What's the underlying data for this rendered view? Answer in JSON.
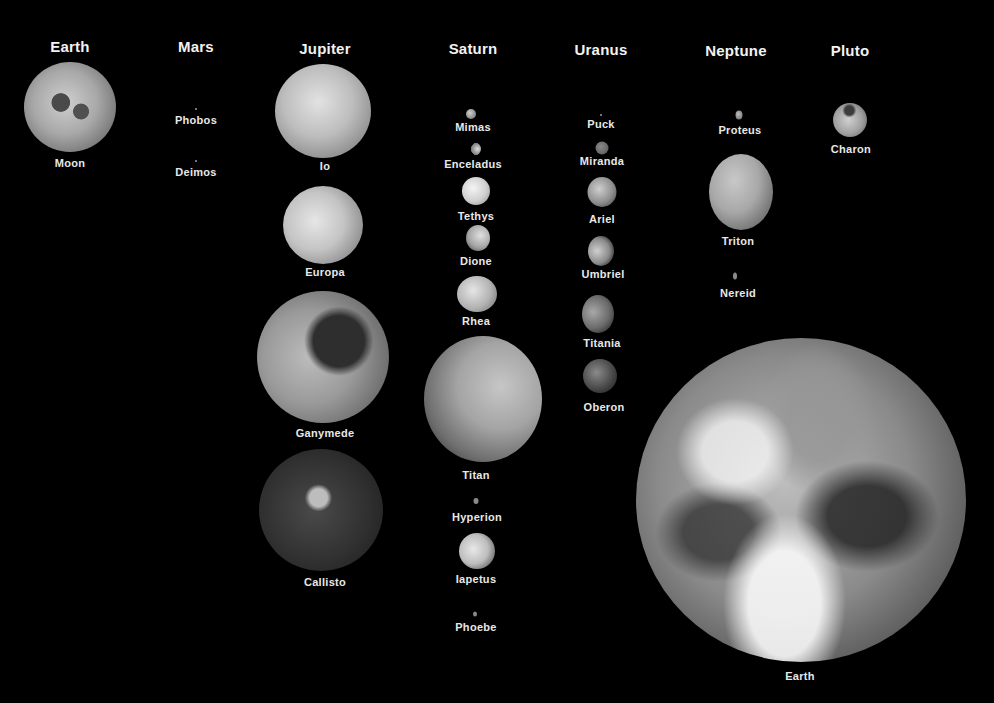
{
  "headings": {
    "earth": "Earth",
    "mars": "Mars",
    "jupiter": "Jupiter",
    "saturn": "Saturn",
    "uranus": "Uranus",
    "neptune": "Neptune",
    "pluto": "Pluto"
  },
  "moons": {
    "earth": [
      "Moon"
    ],
    "mars": [
      "Phobos",
      "Deimos"
    ],
    "jupiter": [
      "Io",
      "Europa",
      "Ganymede",
      "Callisto"
    ],
    "saturn": [
      "Mimas",
      "Enceladus",
      "Tethys",
      "Dione",
      "Rhea",
      "Titan",
      "Hyperion",
      "Iapetus",
      "Phoebe"
    ],
    "uranus": [
      "Puck",
      "Miranda",
      "Ariel",
      "Umbriel",
      "Titania",
      "Oberon"
    ],
    "neptune": [
      "Proteus",
      "Triton",
      "Nereid"
    ],
    "pluto": [
      "Charon"
    ]
  },
  "reference": {
    "label": "Earth"
  }
}
